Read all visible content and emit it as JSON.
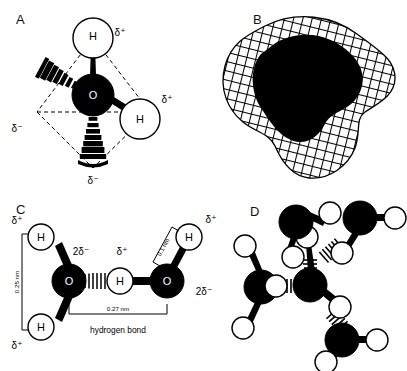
{
  "figure": {
    "background": "#ffffff",
    "ink": "#000000"
  },
  "panels": [
    {
      "letter": "A",
      "name": "tetrahedral-water-molecule",
      "description": "Ball-and-stick water molecule inside a dashed tetrahedron, showing two hydrogens and two lone pairs",
      "atoms": [
        {
          "label": "O",
          "type": "oxygen",
          "fill": "#000000",
          "text_color": "#ffffff"
        },
        {
          "label": "H",
          "type": "hydrogen",
          "fill": "#ffffff",
          "text_color": "#000000"
        },
        {
          "label": "H",
          "type": "hydrogen",
          "fill": "#ffffff",
          "text_color": "#000000"
        }
      ],
      "charges": [
        {
          "text": "δ⁺",
          "position": "top-right"
        },
        {
          "text": "δ⁺",
          "position": "right"
        },
        {
          "text": "δ⁻",
          "position": "left"
        },
        {
          "text": "δ⁻",
          "position": "bottom"
        }
      ],
      "lone_pairs": 2
    },
    {
      "letter": "B",
      "name": "space-filling-mesh-model",
      "description": "Space-filling electron-cloud surface of water drawn as a wireframe mesh with solid dark interior",
      "mesh": true
    },
    {
      "letter": "C",
      "name": "hydrogen-bond-geometry",
      "description": "Two water molecules joined by a hydrogen bond with bond distances labelled",
      "atoms": [
        {
          "label": "H"
        },
        {
          "label": "H"
        },
        {
          "label": "O"
        },
        {
          "label": "H"
        },
        {
          "label": "O"
        },
        {
          "label": "H"
        }
      ],
      "charges": [
        {
          "text": "δ⁺",
          "position": "left-top"
        },
        {
          "text": "δ⁺",
          "position": "left-bottom"
        },
        {
          "text": "2δ⁻",
          "position": "left-oxygen"
        },
        {
          "text": "δ⁺",
          "position": "bridging-hydrogen"
        },
        {
          "text": "δ⁺",
          "position": "right-top"
        },
        {
          "text": "2δ⁻",
          "position": "right-oxygen"
        }
      ],
      "distances": [
        {
          "value": "0.25 nm",
          "name": "h-to-h-distance",
          "orientation": "vertical"
        },
        {
          "value": "0.27 nm",
          "name": "hydrogen-bond-distance",
          "orientation": "horizontal"
        },
        {
          "value": "0.1 nm",
          "name": "covalent-oh-distance",
          "orientation": "diagonal"
        }
      ],
      "caption": "hydrogen bond"
    },
    {
      "letter": "D",
      "name": "tetrahedral-hydrogen-bond-network",
      "description": "Central water molecule hydrogen bonded to four neighbouring water molecules",
      "neighbours": 4
    }
  ]
}
